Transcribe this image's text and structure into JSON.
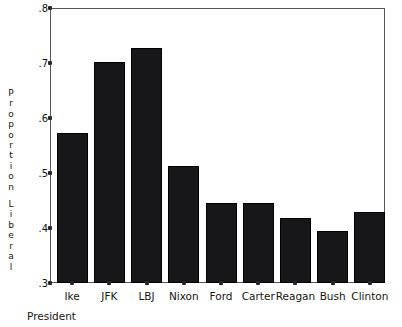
{
  "chart_data": {
    "type": "bar",
    "title": "",
    "subtitle": "",
    "xlabel": "President",
    "ylabel": "Proportion Liberal",
    "categories": [
      "Ike",
      "JFK",
      "LBJ",
      "Nixon",
      "Ford",
      "Carter",
      "Reagan",
      "Bush",
      "Clinton"
    ],
    "values": [
      0.573,
      0.702,
      0.727,
      0.513,
      0.446,
      0.445,
      0.418,
      0.395,
      0.429
    ],
    "ylim": [
      0.3,
      0.8
    ],
    "yticks": [
      0.3,
      0.4,
      0.5,
      0.6,
      0.7,
      0.8
    ],
    "ytick_labels": [
      ".3",
      ".4",
      ".5",
      ".6",
      ".7",
      ".8"
    ],
    "grid": false,
    "legend": null,
    "legend_position": "none",
    "bar_color": "#17171a",
    "axis_color": "#55555c",
    "text_color": "#151515",
    "background": "#ffffff"
  },
  "axis": {
    "y_label_words": [
      "Proportion",
      "Liberal"
    ],
    "x_title": "President"
  }
}
